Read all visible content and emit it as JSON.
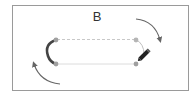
{
  "diagram": {
    "label": "B",
    "colors": {
      "frame_border": "#9a9a9a",
      "path_line": "#c8c8c8",
      "anchor": "#a0a0a0",
      "selected_segment": "#444444",
      "arrow": "#666666",
      "pencil": "#222222"
    },
    "elements": {
      "frame": "bounding-box",
      "path": "rounded-rectangle-path",
      "selected_segment": "left-arc-segment",
      "anchors": [
        "top-left",
        "top-right",
        "bottom-left",
        "bottom-right"
      ],
      "tool_icon": "pencil-icon",
      "arrows": [
        "clockwise-arrow-top-right",
        "counterclockwise-arrow-bottom-left"
      ]
    }
  }
}
